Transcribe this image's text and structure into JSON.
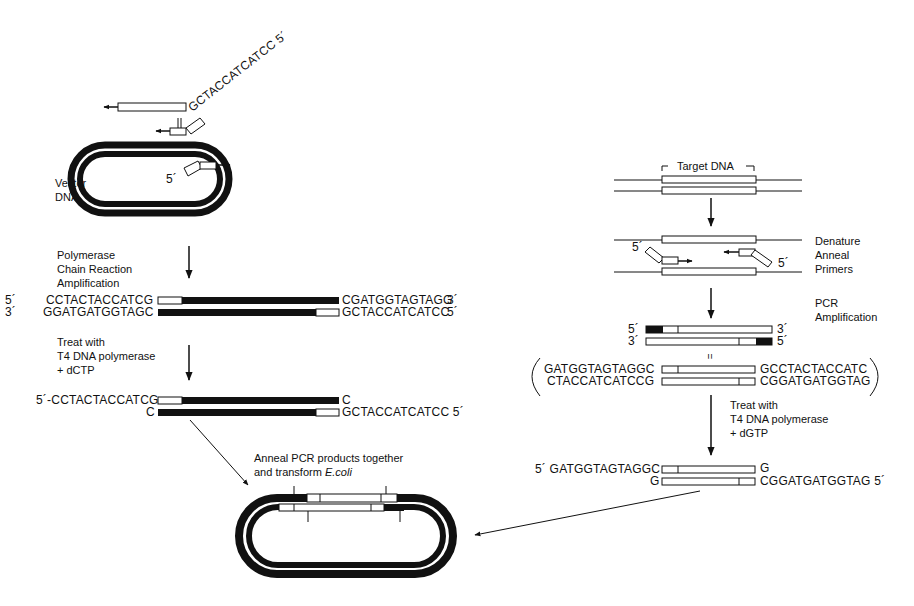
{
  "left_panel": {
    "primer_top_seq": "GCTACCATCATCC",
    "primer_top_end": "5´",
    "vector_label_1": "Vector",
    "vector_label_2": "DNA",
    "inner_primer_end": "5´",
    "step1": [
      "Polymerase",
      "Chain Reaction",
      "Amplification"
    ],
    "product1": {
      "top": {
        "five_label": "5´",
        "left_seq": "CCTACTACCATCG",
        "right_seq": "CGATGGTAGTAGG",
        "three_label": "3´"
      },
      "bottom": {
        "three_label": "3´",
        "left_seq": "GGATGATGGTAGC",
        "right_seq": "GCTACCATCATCC",
        "five_label": "5´"
      }
    },
    "step2": [
      "Treat with",
      "T4 DNA polymerase",
      "+ dCTP"
    ],
    "product2": {
      "top": {
        "left_seq": "5´-CCTACTACCATCG",
        "right_seq": "C"
      },
      "bottom": {
        "left_seq": "C",
        "right_seq": "GCTACCATCATCC 5´"
      }
    }
  },
  "right_panel": {
    "target_label": "Target DNA",
    "step1": [
      "Denature",
      "Anneal",
      "Primers"
    ],
    "primer_left_end": "5´",
    "primer_right_end": "5´",
    "step2": [
      "PCR",
      "Amplification"
    ],
    "product1": {
      "top": {
        "five_label": "5´",
        "three_label": "3´"
      },
      "bottom": {
        "three_label": "3´",
        "five_label": "5´"
      }
    },
    "equals": "=",
    "expanded": {
      "top": {
        "left_seq": "GATGGTAGTAGGC",
        "right_seq": "GCCTACTACCATC"
      },
      "bottom": {
        "left_seq": "CTACCATCATCCG",
        "right_seq": "CGGATGATGGTAG"
      }
    },
    "step3": [
      "Treat with",
      "T4 DNA polymerase",
      "+ dGTP"
    ],
    "product2": {
      "top": {
        "left_seq": "5´ GATGGTAGTAGGC",
        "right_seq": "G"
      },
      "bottom": {
        "left_seq": "G",
        "right_seq": "CGGATGATGGTAG  5´"
      }
    }
  },
  "bottom": {
    "anneal_line1": "Anneal PCR products together",
    "anneal_line2_prefix": "and transform ",
    "anneal_line2_organism": "E.coli"
  },
  "colors": {
    "ink": "#111111",
    "paper": "#ffffff"
  }
}
